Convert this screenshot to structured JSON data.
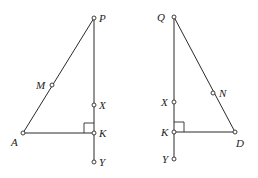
{
  "figures": [
    {
      "name": "left-triangle",
      "points": {
        "P": {
          "label": "P",
          "x": 94,
          "y": 18
        },
        "M": {
          "label": "M",
          "x": 52,
          "y": 85
        },
        "X": {
          "label": "X",
          "x": 94,
          "y": 105
        },
        "A": {
          "label": "A",
          "x": 23,
          "y": 133
        },
        "K": {
          "label": "K",
          "x": 94,
          "y": 133
        },
        "Y": {
          "label": "Y",
          "x": 94,
          "y": 162
        }
      },
      "segments": [
        "PA",
        "AK",
        "PY"
      ],
      "right_angle_at": "K"
    },
    {
      "name": "right-triangle",
      "points": {
        "Q": {
          "label": "Q",
          "x": 174,
          "y": 17
        },
        "N": {
          "label": "N",
          "x": 213,
          "y": 93
        },
        "X": {
          "label": "X",
          "x": 174,
          "y": 102
        },
        "K": {
          "label": "K",
          "x": 174,
          "y": 132
        },
        "D": {
          "label": "D",
          "x": 235,
          "y": 132
        },
        "Y": {
          "label": "Y",
          "x": 174,
          "y": 159
        }
      },
      "segments": [
        "QD",
        "KD",
        "QY"
      ],
      "right_angle_at": "K"
    }
  ]
}
